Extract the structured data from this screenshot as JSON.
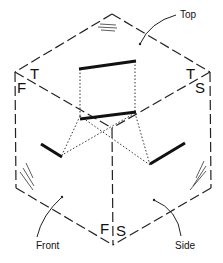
{
  "diagram": {
    "face_labels": {
      "top": "Top",
      "front": "Front",
      "side": "Side"
    },
    "corner_letters": {
      "left_T": "T",
      "left_F": "F",
      "right_T": "T",
      "right_S": "S",
      "bottom_F": "F",
      "bottom_S": "S"
    }
  }
}
